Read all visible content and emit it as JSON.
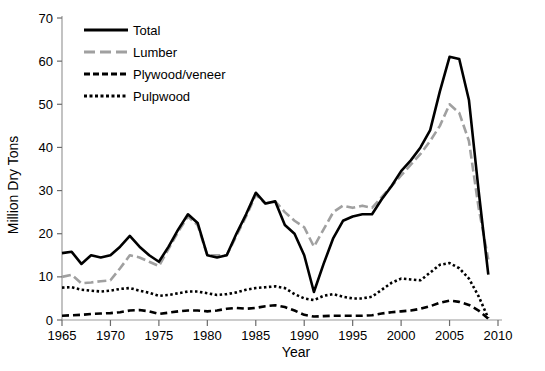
{
  "chart_data": {
    "type": "line",
    "title": "",
    "xlabel": "Year",
    "ylabel": "Million Dry Tons",
    "xlim": [
      1965,
      2010
    ],
    "ylim": [
      0,
      70
    ],
    "xticks": [
      1965,
      1970,
      1975,
      1980,
      1985,
      1990,
      1995,
      2000,
      2005,
      2010
    ],
    "yticks": [
      0,
      10,
      20,
      30,
      40,
      50,
      60,
      70
    ],
    "grid": false,
    "legend_position": "top-left",
    "x": [
      1965,
      1966,
      1967,
      1968,
      1969,
      1970,
      1971,
      1972,
      1973,
      1974,
      1975,
      1976,
      1977,
      1978,
      1979,
      1980,
      1981,
      1982,
      1983,
      1984,
      1985,
      1986,
      1987,
      1988,
      1989,
      1990,
      1991,
      1992,
      1993,
      1994,
      1995,
      1996,
      1997,
      1998,
      1999,
      2000,
      2001,
      2002,
      2003,
      2004,
      2005,
      2006,
      2007,
      2008,
      2009
    ],
    "series": [
      {
        "name": "Total",
        "color": "#000000",
        "style": "solid",
        "values": [
          15.5,
          15.8,
          13.0,
          15.0,
          14.5,
          15.0,
          17.0,
          19.5,
          17.0,
          15.0,
          13.5,
          17.0,
          21.0,
          24.5,
          22.5,
          15.0,
          14.5,
          15.0,
          20.0,
          24.5,
          29.5,
          27.0,
          27.5,
          22.0,
          20.0,
          15.0,
          6.5,
          13.0,
          19.0,
          23.0,
          24.0,
          24.5,
          24.5,
          28.0,
          31.0,
          34.5,
          37.0,
          40.0,
          44.0,
          53.0,
          61.0,
          60.5,
          51.0,
          30.0,
          10.5
        ]
      },
      {
        "name": "Lumber",
        "color": "#a0a0a0",
        "style": "dashed-long",
        "values": [
          10.0,
          10.5,
          8.5,
          8.7,
          9.0,
          9.2,
          12.0,
          15.0,
          14.5,
          13.5,
          12.5,
          16.5,
          20.5,
          24.0,
          22.0,
          15.0,
          15.0,
          15.0,
          19.5,
          24.0,
          29.0,
          27.0,
          27.5,
          25.0,
          23.0,
          21.5,
          17.0,
          21.0,
          25.0,
          26.5,
          26.0,
          26.5,
          26.0,
          28.5,
          31.0,
          33.5,
          36.0,
          38.5,
          41.5,
          45.0,
          50.0,
          48.0,
          41.5,
          26.0,
          14.0
        ]
      },
      {
        "name": "Plywood/veneer",
        "color": "#000000",
        "style": "dashed",
        "values": [
          1.0,
          1.1,
          1.2,
          1.4,
          1.5,
          1.6,
          1.8,
          2.2,
          2.3,
          2.0,
          1.4,
          1.7,
          2.0,
          2.2,
          2.2,
          2.0,
          2.2,
          2.6,
          2.8,
          2.6,
          2.8,
          3.2,
          3.4,
          3.0,
          2.2,
          1.2,
          0.8,
          0.9,
          1.0,
          1.0,
          1.0,
          1.0,
          1.1,
          1.5,
          1.8,
          2.0,
          2.2,
          2.6,
          3.2,
          4.0,
          4.5,
          4.2,
          3.5,
          2.2,
          0.3
        ]
      },
      {
        "name": "Pulpwood",
        "color": "#000000",
        "style": "dotted",
        "values": [
          7.5,
          7.6,
          7.0,
          6.8,
          6.6,
          6.8,
          7.2,
          7.4,
          6.8,
          6.3,
          5.6,
          5.8,
          6.2,
          6.6,
          6.6,
          6.2,
          5.8,
          6.0,
          6.4,
          7.0,
          7.4,
          7.6,
          7.8,
          7.4,
          6.0,
          5.0,
          4.6,
          5.6,
          6.0,
          5.4,
          5.0,
          5.0,
          5.4,
          7.0,
          8.6,
          9.6,
          9.4,
          9.2,
          11.0,
          12.8,
          13.2,
          12.0,
          9.6,
          5.5,
          0.4
        ]
      }
    ]
  },
  "legend": {
    "items": [
      {
        "label": "Total"
      },
      {
        "label": "Lumber"
      },
      {
        "label": "Plywood/veneer"
      },
      {
        "label": "Pulpwood"
      }
    ]
  }
}
